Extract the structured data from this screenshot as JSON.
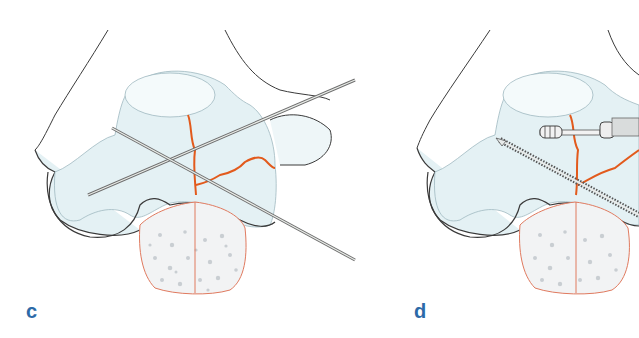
{
  "figure": {
    "panels": [
      {
        "id": "c",
        "label": "c",
        "description": "Distal humerus with intercondylar fracture lines fixed by two crossed K-wires"
      },
      {
        "id": "d",
        "label": "d",
        "description": "Distal humerus fracture fixed with a cannulated screw and a long threaded screw"
      }
    ],
    "colors": {
      "bone_fill": "#e4f1f4",
      "bone_shade": "#cfe5ea",
      "outline": "#3a3a3a",
      "fracture_line": "#e25a1c",
      "cancellous_outline": "#e07a5f",
      "cancellous_dots": "#c9ced2",
      "wire": "#6e6e6e",
      "label": "#2c6aa8"
    }
  }
}
